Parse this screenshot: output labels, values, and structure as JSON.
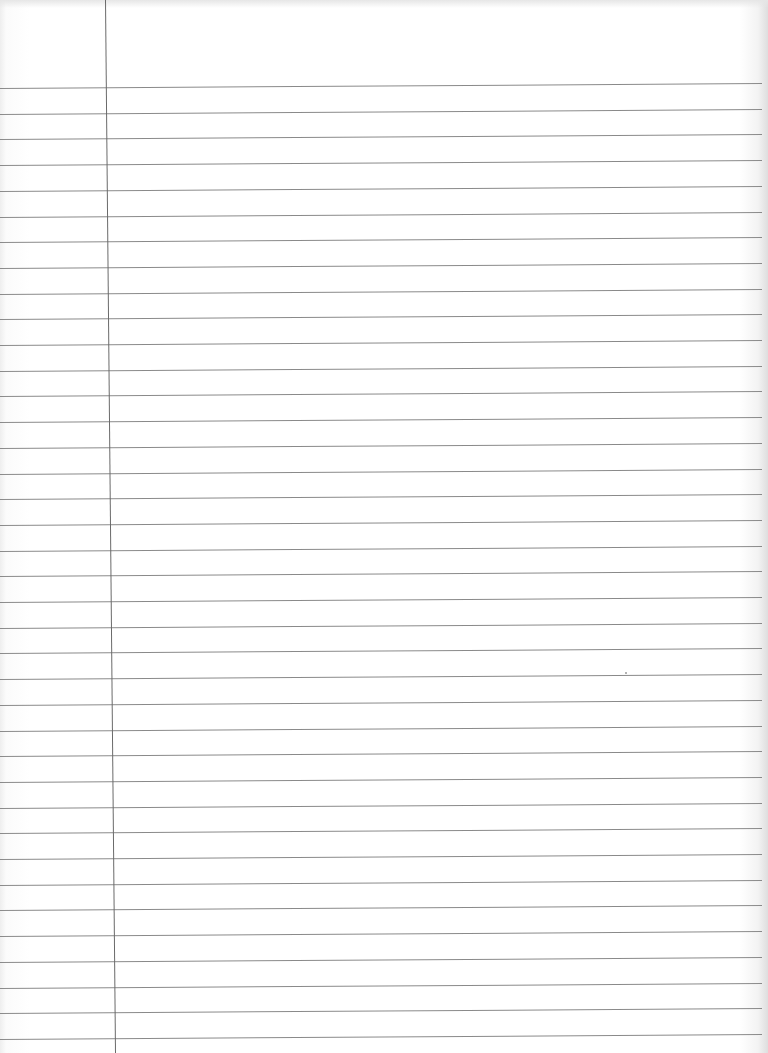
{
  "page": {
    "type": "lined-notebook-paper",
    "ruled_line_count": 38,
    "first_line_y": 88,
    "line_spacing_px": 25.7,
    "line_slope_px_across_width": -5,
    "margin_line_x_top": 105,
    "margin_line_x_bottom": 115,
    "colors": {
      "paper": "#ffffff",
      "rule": "#8a8a8a",
      "margin": "#6a6a6a",
      "edge_shadow": "#dedede"
    },
    "text_content": []
  }
}
